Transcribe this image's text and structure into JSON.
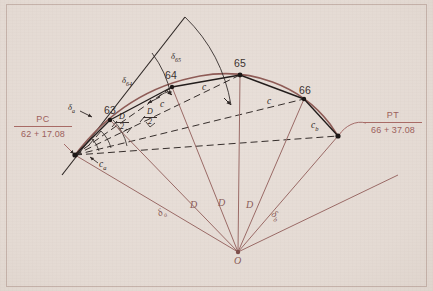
{
  "figure": {
    "type": "surveying-horizontal-curve-diagram",
    "background_color": "#e4dad3",
    "curve_color": "#8e5b56",
    "chord_color": "#262020",
    "radial_color": "#9a6a66",
    "stations": [
      {
        "id": "63",
        "label": "63",
        "x": 110,
        "y": 120
      },
      {
        "id": "64",
        "label": "64",
        "x": 172,
        "y": 87
      },
      {
        "id": "65",
        "label": "65",
        "x": 240,
        "y": 75
      },
      {
        "id": "66",
        "label": "66",
        "x": 304,
        "y": 99
      }
    ],
    "endpoints": {
      "pc": {
        "name": "PC",
        "station": "62 + 17.08",
        "x": 75,
        "y": 155
      },
      "pt": {
        "name": "PT",
        "station": "66 + 37.08",
        "x": 338,
        "y": 136
      },
      "center": {
        "name": "O",
        "label": "O",
        "x": 238,
        "y": 252
      }
    },
    "chord_labels": [
      {
        "id": "c-a",
        "text": "c",
        "sub": "a"
      },
      {
        "id": "c-1",
        "text": "c",
        "sub": ""
      },
      {
        "id": "c-2",
        "text": "c",
        "sub": ""
      },
      {
        "id": "c-3",
        "text": "c",
        "sub": ""
      },
      {
        "id": "c-b",
        "text": "c",
        "sub": "b"
      }
    ],
    "deflection_labels": [
      {
        "id": "delta-a",
        "text": "δ",
        "sub": "a"
      },
      {
        "id": "delta-64",
        "text": "δ",
        "sub": "64"
      },
      {
        "id": "delta-65",
        "text": "δ",
        "sub": "65"
      }
    ],
    "half_degree_labels": [
      {
        "id": "d-over-2-left",
        "num": "D",
        "den": "2"
      },
      {
        "id": "d-over-2-right",
        "num": "D",
        "den": "2"
      }
    ],
    "central_angle_labels": [
      {
        "id": "central-delta-a",
        "text": "δ",
        "sub": "a"
      },
      {
        "id": "central-D-1",
        "text": "D",
        "sub": ""
      },
      {
        "id": "central-D-2",
        "text": "D",
        "sub": ""
      },
      {
        "id": "central-D-3",
        "text": "D",
        "sub": ""
      },
      {
        "id": "central-delta-b",
        "text": "δ",
        "sub": "b"
      }
    ]
  }
}
